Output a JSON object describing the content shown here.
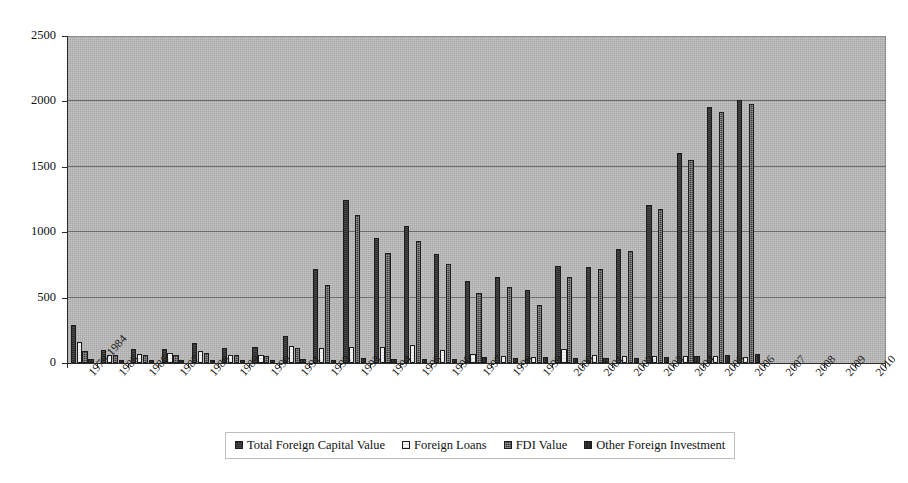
{
  "chart_data": {
    "type": "bar",
    "title": "",
    "subtitle": "",
    "xlabel": "",
    "ylabel": "",
    "ylim": [
      0,
      2500
    ],
    "ytick_labels": [
      "0",
      "500",
      "1000",
      "1500",
      "2000",
      "2500"
    ],
    "ytick_values": [
      0,
      500,
      1000,
      1500,
      2000,
      2500
    ],
    "grid": true,
    "legend_position": "bottom-center",
    "plot_background": "#b2b2b2",
    "categories": [
      "1979-1984",
      "1985",
      "1986",
      "1987",
      "1988",
      "1989",
      "1990",
      "1991",
      "1992",
      "1993",
      "1994",
      "1995",
      "1996",
      "1997",
      "1998",
      "1999",
      "2000",
      "2001",
      "2002",
      "2003",
      "2004",
      "2005",
      "2006",
      "2007",
      "2008",
      "2009",
      "2010"
    ],
    "series": [
      {
        "name": "Total Foreign Capital Value",
        "color": "#2e2e2e",
        "values": [
          290,
          100,
          110,
          110,
          155,
          115,
          120,
          205,
          720,
          1250,
          955,
          1045,
          830,
          625,
          655,
          555,
          740,
          735,
          875,
          1205,
          1605,
          1955,
          2010,
          0,
          0,
          0,
          0
        ]
      },
      {
        "name": "Foreign Loans",
        "color": "#f2f2f2",
        "values": [
          160,
          65,
          70,
          75,
          95,
          65,
          65,
          130,
          115,
          120,
          120,
          135,
          100,
          70,
          55,
          45,
          110,
          60,
          55,
          55,
          50,
          50,
          45,
          0,
          0,
          0,
          0
        ]
      },
      {
        "name": "FDI Value",
        "color": "#3a3a3a",
        "values": [
          95,
          60,
          65,
          60,
          80,
          60,
          55,
          115,
          600,
          1130,
          840,
          935,
          755,
          535,
          580,
          440,
          655,
          720,
          855,
          1180,
          1550,
          1920,
          1980,
          0,
          0,
          0,
          0
        ]
      },
      {
        "name": "Other Foreign Investment",
        "color": "#262626",
        "values": [
          30,
          20,
          22,
          20,
          25,
          20,
          20,
          30,
          25,
          35,
          30,
          30,
          30,
          45,
          40,
          45,
          35,
          35,
          40,
          45,
          55,
          60,
          70,
          0,
          0,
          0,
          0
        ]
      }
    ]
  },
  "legend": {
    "items": [
      {
        "label": "Total Foreign Capital Value",
        "swatch": "series-0-swatch"
      },
      {
        "label": "Foreign Loans",
        "swatch": "series-1-swatch"
      },
      {
        "label": "FDI Value",
        "swatch": "series-2-swatch"
      },
      {
        "label": "Other Foreign Investment",
        "swatch": "series-3-swatch"
      }
    ]
  }
}
